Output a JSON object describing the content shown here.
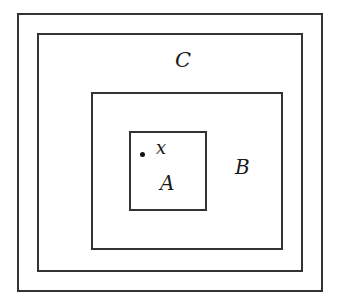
{
  "diagram": {
    "type": "nested-sets",
    "sets": [
      {
        "id": "outer",
        "label": ""
      },
      {
        "id": "C",
        "label": "C"
      },
      {
        "id": "B",
        "label": "B"
      },
      {
        "id": "A",
        "label": "A"
      }
    ],
    "point": {
      "label": "x",
      "inside": "A"
    },
    "colors": {
      "stroke": "#333333",
      "background": "#ffffff",
      "text": "#1a1a1a"
    }
  }
}
